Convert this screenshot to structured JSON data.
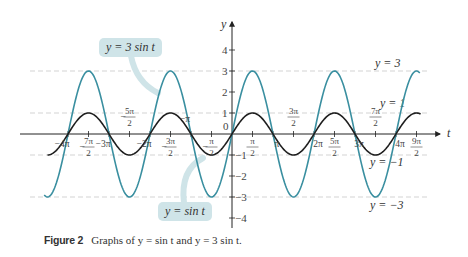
{
  "chart_data": {
    "type": "line",
    "title": "Graphs of y = sin t and y = 3 sin t",
    "xlabel": "t",
    "ylabel": "y",
    "xlim_pi": [
      -4.5,
      4.6
    ],
    "ylim": [
      -4,
      4
    ],
    "grid": false,
    "series": [
      {
        "name": "y = sin t",
        "amplitude": 1,
        "color": "#1e1e1e",
        "x_range_pi": [
          -4.5,
          4.6
        ]
      },
      {
        "name": "y = 3 sin t",
        "amplitude": 3,
        "color": "#3a8fa0",
        "x_range_pi": [
          -4.6,
          4.6
        ]
      }
    ],
    "reference_lines": [
      {
        "y": 3,
        "label": "y = 3"
      },
      {
        "y": 1,
        "label": "y = 1"
      },
      {
        "y": -1,
        "label": "y = −1"
      },
      {
        "y": -3,
        "label": "y = −3"
      }
    ],
    "x_ticks": [
      {
        "value_pi": -4,
        "label": "−4π"
      },
      {
        "value_pi": -3.5,
        "label": "−7π/2"
      },
      {
        "value_pi": -3,
        "label": "−3π"
      },
      {
        "value_pi": -2.5,
        "label": "−5π/2"
      },
      {
        "value_pi": -2,
        "label": "−2π"
      },
      {
        "value_pi": -1.5,
        "label": "−3π/2"
      },
      {
        "value_pi": -1,
        "label": "−π"
      },
      {
        "value_pi": -0.5,
        "label": "−π/2"
      },
      {
        "value_pi": 0,
        "label": "0"
      },
      {
        "value_pi": 0.5,
        "label": "π/2"
      },
      {
        "value_pi": 1,
        "label": "π"
      },
      {
        "value_pi": 1.5,
        "label": "3π/2"
      },
      {
        "value_pi": 2,
        "label": "2π"
      },
      {
        "value_pi": 2.5,
        "label": "5π/2"
      },
      {
        "value_pi": 3,
        "label": "3π"
      },
      {
        "value_pi": 3.5,
        "label": "7π/2"
      },
      {
        "value_pi": 4,
        "label": "4π"
      },
      {
        "value_pi": 4.5,
        "label": "9π/2"
      }
    ],
    "y_ticks": [
      -4,
      -3,
      -2,
      -1,
      1,
      2,
      3,
      4
    ],
    "annotations": [
      "y = 3 sin t",
      "y = sin t"
    ]
  },
  "caption": {
    "figure_label": "Figure 2",
    "text": "Graphs of y = sin t and y = 3 sin t."
  },
  "bubbles": {
    "three_sin": "y = 3 sin t",
    "sin": "y = sin t"
  },
  "colors": {
    "teal": "#3a8fa0",
    "black": "#1e1e1e",
    "bubble": "#cfe4e8",
    "dashed": "#c8c8c8"
  }
}
